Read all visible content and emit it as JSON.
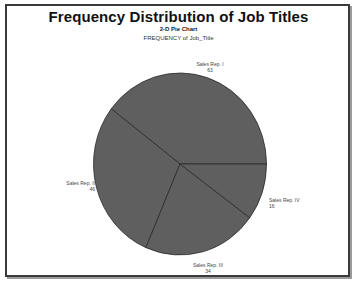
{
  "chart_data": {
    "type": "pie",
    "title": "Frequency Distribution of Job Titles",
    "subtitle": "2-D Pie Chart",
    "subsubtitle": "FREQUENCY of Job_Title",
    "categories": [
      "Sales Rep. I",
      "Sales Rep. II",
      "Sales Rep. III",
      "Sales Rep. IV"
    ],
    "values": [
      63,
      46,
      34,
      16
    ],
    "slice_color": "#5f5f5f",
    "slice_border": "#2a2a2a",
    "legend": "none (slice labels outside)",
    "grid": false
  },
  "labels": {
    "rep1": {
      "name": "Sales Rep. I",
      "value": "63"
    },
    "rep2": {
      "name": "Sales Rep. II",
      "value": "46"
    },
    "rep3": {
      "name": "Sales Rep. III",
      "value": "34"
    },
    "rep4": {
      "name": "Sales Rep. IV",
      "value": "16"
    }
  }
}
